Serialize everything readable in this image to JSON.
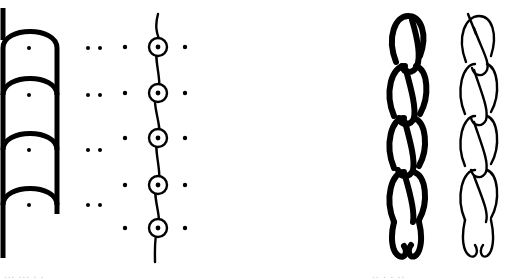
{
  "figure": {
    "background_color": "#ffffff",
    "ink_color": "#000000",
    "width": 514,
    "height": 280
  },
  "panels": {
    "schematic_hooks": {
      "name": "hook-arch-schematic",
      "stroke_color": "#000000",
      "stroke_width": 5,
      "dot_color": "#000000",
      "dot_radius": 2,
      "rows": 4,
      "row_y": [
        48,
        95,
        150,
        205
      ],
      "arch_left_x": 2,
      "arch_right_x": 57,
      "stem_x": 57,
      "center_dot_x": 29,
      "tail_top_y": 8,
      "tail_bottom_y": 258
    },
    "dot_pairs": {
      "name": "dot-pair-column",
      "dot_color": "#000000",
      "dot_radius": 2,
      "rows": 4,
      "row_y": [
        48,
        95,
        150,
        205
      ],
      "dot_x": [
        62,
        73
      ]
    },
    "wavy_loops": {
      "name": "wavy-line-with-circled-dots",
      "stroke_color": "#000000",
      "stroke_width": 2,
      "dot_color": "#000000",
      "dot_radius": 2,
      "circle_radius": 9,
      "rows": 5,
      "row_y": [
        47,
        93,
        138,
        185,
        228
      ],
      "left_dot_x": 15,
      "circle_x": 48,
      "right_dot_x": 75,
      "line_top_y": 14,
      "line_bottom_y": 262,
      "wave_amplitude": 5
    },
    "chain_thick": {
      "name": "crochet-chain-thick",
      "stroke_color": "#000000",
      "stroke_width": 6,
      "links": 5,
      "link_pitch": 52,
      "top_y": 14,
      "bottom_y": 262
    },
    "chain_thin": {
      "name": "crochet-chain-thin",
      "stroke_color": "#000000",
      "stroke_width": 2,
      "links": 5,
      "link_pitch": 52,
      "top_y": 14,
      "bottom_y": 262
    }
  },
  "bottom_sliver": {
    "left_fragment": "...  ... . .",
    "right_fragment": ".. .  . ..",
    "color": "#c9c9cf"
  }
}
